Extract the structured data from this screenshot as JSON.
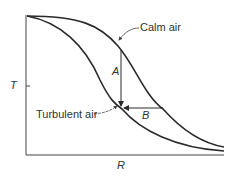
{
  "figure": {
    "y_axis_label": "T",
    "x_axis_label": "R",
    "curves": [
      {
        "name": "calm-air-curve",
        "label": "Calm air"
      },
      {
        "name": "turbulent-air-curve",
        "label": "Turbulent air"
      }
    ],
    "annotations": {
      "vertical_arrow": "A",
      "horizontal_arrow": "B"
    },
    "line_color": "#2a2a2a"
  }
}
